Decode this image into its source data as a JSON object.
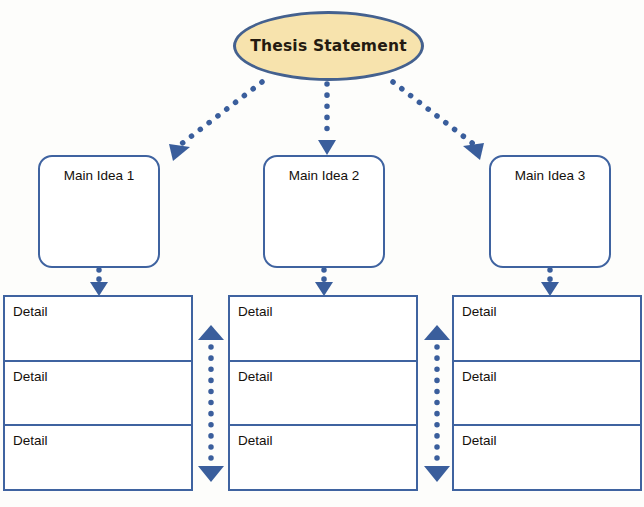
{
  "diagram": {
    "type": "hierarchical-graphic-organizer",
    "colors": {
      "border_blue": "#3f63a0",
      "ellipse_border": "#44618f",
      "ellipse_fill": "#f7e3ad",
      "arrow_blue": "#3a5e9c",
      "text_dark": "#14100c",
      "background": "#fdfdfb"
    },
    "root": {
      "label": "Thesis Statement",
      "shape": "ellipse"
    },
    "branches": [
      {
        "label": "Main Idea 1",
        "shape": "rounded-rectangle",
        "details": [
          "Detail",
          "Detail",
          "Detail"
        ]
      },
      {
        "label": "Main Idea 2",
        "shape": "rounded-rectangle",
        "details": [
          "Detail",
          "Detail",
          "Detail"
        ]
      },
      {
        "label": "Main Idea 3",
        "shape": "rounded-rectangle",
        "details": [
          "Detail",
          "Detail",
          "Detail"
        ]
      }
    ],
    "connectors": {
      "style": "dotted",
      "root_to_branch": [
        {
          "from": "Thesis Statement",
          "to": "Main Idea 1",
          "direction": "diagonal-down-left"
        },
        {
          "from": "Thesis Statement",
          "to": "Main Idea 2",
          "direction": "vertical-down"
        },
        {
          "from": "Thesis Statement",
          "to": "Main Idea 3",
          "direction": "diagonal-down-right"
        }
      ],
      "branch_to_details": [
        {
          "from": "Main Idea 1",
          "to": "detail-table-1",
          "direction": "vertical-down"
        },
        {
          "from": "Main Idea 2",
          "to": "detail-table-2",
          "direction": "vertical-down"
        },
        {
          "from": "Main Idea 3",
          "to": "detail-table-3",
          "direction": "vertical-down"
        }
      ],
      "between_detail_columns": [
        {
          "between": [
            "detail-table-1",
            "detail-table-2"
          ],
          "style": "double-headed-dotted-vertical"
        },
        {
          "between": [
            "detail-table-2",
            "detail-table-3"
          ],
          "style": "double-headed-dotted-vertical"
        }
      ]
    }
  }
}
